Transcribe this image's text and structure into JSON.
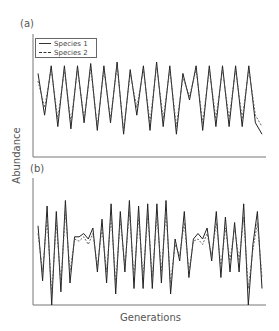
{
  "chart_data": [
    {
      "type": "line",
      "panel": "(a)",
      "title": "",
      "xlabel": "Generations",
      "ylabel": "Abundance",
      "grid": false,
      "legend_position": "upper left",
      "x": [
        1,
        2,
        3,
        4,
        5,
        6,
        7,
        8,
        9,
        10,
        11,
        12,
        13,
        14,
        15,
        16,
        17,
        18,
        19,
        20,
        21,
        22,
        23,
        24,
        25,
        26,
        27,
        28,
        29,
        30,
        31,
        32,
        33,
        34,
        35
      ],
      "series": [
        {
          "name": "Species 1",
          "style": "solid",
          "values": [
            0.85,
            0.3,
            0.95,
            0.15,
            0.95,
            0.12,
            0.95,
            0.2,
            0.98,
            0.1,
            0.95,
            0.2,
            1.0,
            0.05,
            0.9,
            0.3,
            0.95,
            0.1,
            1.0,
            0.15,
            0.95,
            0.05,
            0.85,
            0.5,
            0.95,
            0.1,
            0.95,
            0.15,
            0.95,
            0.15,
            0.95,
            0.15,
            0.95,
            0.2,
            0.05
          ]
        },
        {
          "name": "Species 2",
          "style": "dashed",
          "values": [
            0.75,
            0.4,
            0.9,
            0.25,
            0.9,
            0.2,
            0.9,
            0.25,
            0.92,
            0.15,
            0.9,
            0.25,
            0.95,
            0.1,
            0.85,
            0.4,
            0.9,
            0.2,
            0.95,
            0.25,
            0.9,
            0.15,
            0.8,
            0.55,
            0.9,
            0.2,
            0.9,
            0.25,
            0.9,
            0.25,
            0.9,
            0.25,
            0.9,
            0.3,
            0.15
          ]
        }
      ],
      "ylim": [
        0,
        1
      ]
    },
    {
      "type": "line",
      "panel": "(b)",
      "title": "",
      "xlabel": "Generations",
      "ylabel": "Abundance",
      "grid": false,
      "x": [
        1,
        2,
        3,
        4,
        5,
        6,
        7,
        8,
        9,
        10,
        11,
        12,
        13,
        14,
        15,
        16,
        17,
        18,
        19,
        20,
        21,
        22,
        23,
        24,
        25,
        26,
        27,
        28,
        29,
        30,
        31,
        32,
        33,
        34,
        35,
        36,
        37,
        38,
        39,
        40,
        41,
        42,
        43,
        44,
        45,
        46,
        47,
        48,
        49,
        50
      ],
      "series": [
        {
          "name": "Species 1",
          "style": "solid",
          "values": [
            0.72,
            0.22,
            0.9,
            0.0,
            0.85,
            0.12,
            0.95,
            0.2,
            0.62,
            0.62,
            0.65,
            0.6,
            0.7,
            0.3,
            0.78,
            0.2,
            0.92,
            0.1,
            0.85,
            0.3,
            0.95,
            0.15,
            0.9,
            0.15,
            0.92,
            0.15,
            0.92,
            0.2,
            0.95,
            0.1,
            0.6,
            0.4,
            0.85,
            0.25,
            0.6,
            0.65,
            0.6,
            0.7,
            0.4,
            0.85,
            0.25,
            0.8,
            0.3,
            0.75,
            0.3,
            0.92,
            0.0,
            0.55,
            0.85,
            0.15
          ]
        },
        {
          "name": "Species 2",
          "style": "dashed",
          "values": [
            0.65,
            0.3,
            0.8,
            0.1,
            0.75,
            0.2,
            0.85,
            0.3,
            0.6,
            0.58,
            0.62,
            0.55,
            0.65,
            0.35,
            0.7,
            0.3,
            0.82,
            0.2,
            0.78,
            0.35,
            0.85,
            0.25,
            0.8,
            0.25,
            0.82,
            0.25,
            0.82,
            0.3,
            0.85,
            0.2,
            0.55,
            0.45,
            0.75,
            0.3,
            0.58,
            0.6,
            0.55,
            0.65,
            0.45,
            0.75,
            0.35,
            0.7,
            0.4,
            0.7,
            0.4,
            0.8,
            0.15,
            0.5,
            0.75,
            0.25
          ]
        }
      ],
      "ylim": [
        0,
        1
      ]
    }
  ],
  "labels": {
    "panel_a": "(a)",
    "panel_b": "(b)",
    "x_axis": "Generations",
    "y_axis": "Abundance",
    "legend": [
      "Species 1",
      "Species 2"
    ]
  }
}
